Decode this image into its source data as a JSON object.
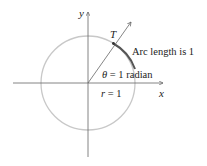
{
  "diagram": {
    "axes": {
      "x_label": "x",
      "y_label": "y"
    },
    "point_label": "T",
    "arc_label": "Arc length is 1",
    "angle_label": {
      "symbol": "θ",
      "equals": "=",
      "value": "1",
      "unit": "radian"
    },
    "radius_label": {
      "symbol": "r",
      "equals": "=",
      "value": "1"
    },
    "colors": {
      "circle": "#c8c8c8",
      "arc": "#555555",
      "axes": "#666666",
      "text": "#222222"
    }
  }
}
